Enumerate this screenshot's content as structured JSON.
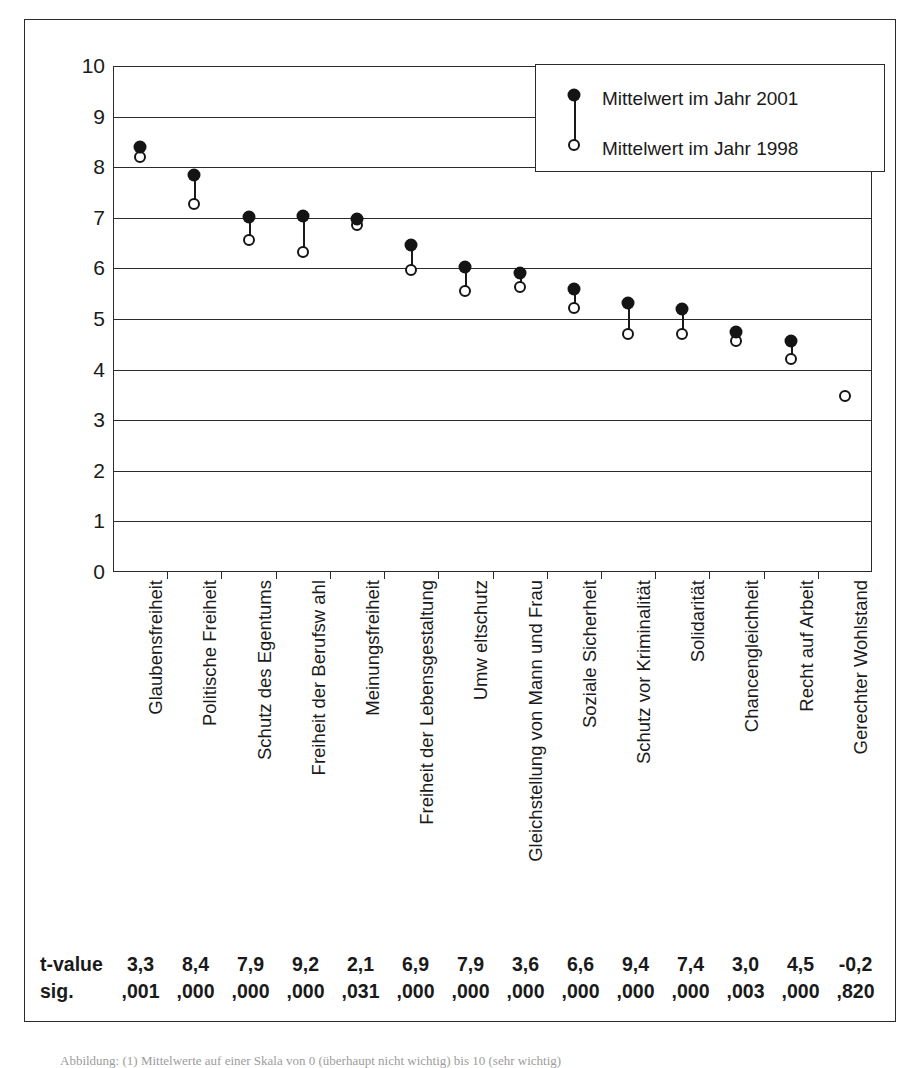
{
  "chart_data": {
    "type": "scatter",
    "title": "",
    "xlabel": "",
    "ylabel": "",
    "ylim": [
      0,
      10
    ],
    "yticks": [
      "0",
      "1",
      "2",
      "3",
      "4",
      "5",
      "6",
      "7",
      "8",
      "9",
      "10"
    ],
    "grid": true,
    "legend_position": "top-right",
    "categories": [
      "Glaubensfreiheit",
      "Politische Freiheit",
      "Schutz des Egentums",
      "Freiheit der Berufsw ahl",
      "Meinungsfreiheit",
      "Freiheit der Lebensgestaltung",
      "Umw eltschutz",
      "Gleichstellung von Mann und Frau",
      "Soziale Sicherheit",
      "Schutz vor Kriminalität",
      "Solidarität",
      "Chancengleichheit",
      "Recht auf Arbeit",
      "Gerechter Wohlstand"
    ],
    "series": [
      {
        "name": "Mittelwert im Jahr 2001",
        "marker": "filled-circle",
        "values": [
          8.4,
          7.85,
          7.02,
          7.03,
          6.97,
          6.47,
          6.02,
          5.9,
          5.6,
          5.32,
          5.2,
          4.75,
          4.57,
          null
        ]
      },
      {
        "name": "Mittelwert im Jahr 1998",
        "marker": "open-circle",
        "values": [
          8.2,
          7.28,
          6.56,
          6.33,
          6.85,
          5.97,
          5.55,
          5.63,
          5.21,
          4.7,
          4.7,
          4.57,
          4.21,
          3.48
        ]
      }
    ],
    "stats": {
      "rows": [
        {
          "label": "t-value",
          "values": [
            "3,3",
            "8,4",
            "7,9",
            "9,2",
            "2,1",
            "6,9",
            "7,9",
            "3,6",
            "6,6",
            "9,4",
            "7,4",
            "3,0",
            "4,5",
            "-0,2"
          ]
        },
        {
          "label": "sig.",
          "values": [
            ",001",
            ",000",
            ",000",
            ",000",
            ",031",
            ",000",
            ",000",
            ",000",
            ",000",
            ",000",
            ",000",
            ",003",
            ",000",
            ",820"
          ]
        }
      ]
    }
  },
  "legend": {
    "series_2001_label": "Mittelwert im Jahr 2001",
    "series_1998_label": "Mittelwert im Jahr 1998"
  },
  "caption": {
    "text": "Abbildung: (1) Mittelwerte auf einer Skala von 0 (überhaupt nicht wichtig) bis 10 (sehr wichtig)"
  }
}
